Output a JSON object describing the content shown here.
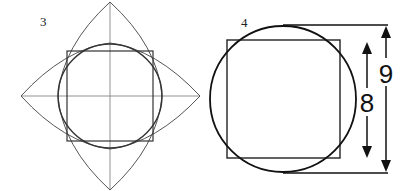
{
  "figures": [
    {
      "label": "3",
      "description": "Square inscribed in circle with four pointed arcs (vesica) construction and center cross lines"
    },
    {
      "label": "4",
      "description": "Square overlapped by a larger circle with dimension arrows",
      "dimensions": [
        {
          "label": "8",
          "refers_to": "square side"
        },
        {
          "label": "9",
          "refers_to": "circle diameter"
        }
      ]
    }
  ],
  "colors": {
    "line": "#333333",
    "thin_line": "#666666",
    "background": "#ffffff"
  }
}
